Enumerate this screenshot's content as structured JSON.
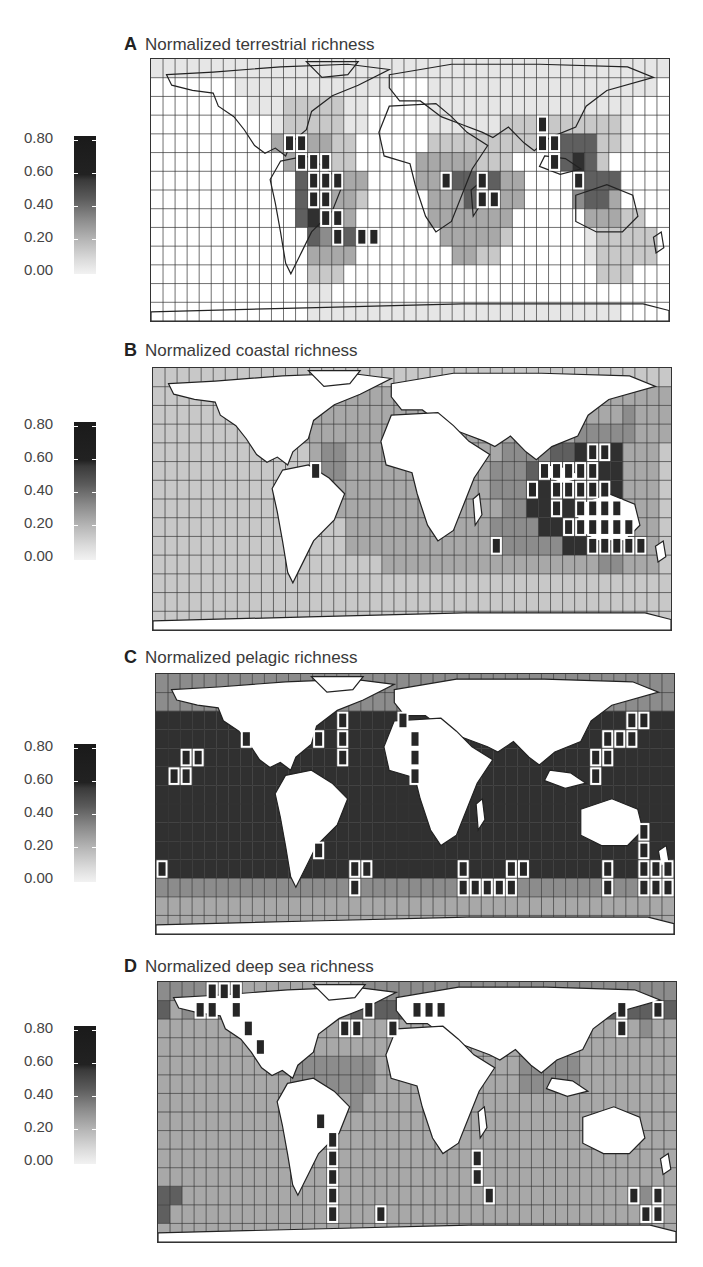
{
  "figure": {
    "panels": [
      {
        "letter": "A",
        "title": "Normalized terrestrial richness",
        "legend_ticks": [
          "0.80",
          "0.60",
          "0.40",
          "0.20",
          "0.00"
        ]
      },
      {
        "letter": "B",
        "title": "Normalized coastal richness",
        "legend_ticks": [
          "0.80",
          "0.60",
          "0.40",
          "0.20",
          "0.00"
        ]
      },
      {
        "letter": "C",
        "title": "Normalized pelagic richness",
        "legend_ticks": [
          "0.80",
          "0.60",
          "0.40",
          "0.20",
          "0.00"
        ]
      },
      {
        "letter": "D",
        "title": "Normalized deep sea richness",
        "legend_ticks": [
          "0.80",
          "0.60",
          "0.40",
          "0.20",
          "0.00"
        ]
      }
    ]
  },
  "colors": {
    "scale_low": "#f2f2f2",
    "scale_high": "#1a1a1a",
    "grid_line": "#333333",
    "land": "#ffffff",
    "highlight_outline": "#ffffff"
  },
  "chart_data": [
    {
      "type": "heatmap",
      "title": "Normalized terrestrial richness",
      "legend": {
        "min": 0.0,
        "max": 0.8,
        "ticks": [
          0.0,
          0.2,
          0.4,
          0.6,
          0.8
        ]
      },
      "grid": "equal-area world grid, ~43 x 14 cells",
      "description": "Terrestrial cells only; ocean cells blank (white). Highest richness (≥0.6, outlined) in Central America, tropical Andes/Amazon, central Africa (Congo/East Africa), Indo-Burma / SE Asia. Moderate (0.3–0.5) across South America, sub-Saharan Africa, South/SE Asia; low (0.1–0.2) in North America, Eurasia, Australia, Antarctica."
    },
    {
      "type": "heatmap",
      "title": "Normalized coastal richness",
      "legend": {
        "min": 0.0,
        "max": 0.8,
        "ticks": [
          0.0,
          0.2,
          0.4,
          0.6,
          0.8
        ]
      },
      "description": "Ocean cells shaded; land white. Peak (≥0.6, outlined) in Coral Triangle / Indo-West Pacific (Philippines, Indonesia, northern Australia), western Indian Ocean near Madagascar, Red Sea / Arabian Sea coast, Caribbean. Open ocean mostly 0.2–0.35."
    },
    {
      "type": "heatmap",
      "title": "Normalized pelagic richness",
      "legend": {
        "min": 0.0,
        "max": 0.8,
        "ticks": [
          0.0,
          0.2,
          0.4,
          0.6,
          0.8
        ]
      },
      "description": "Ocean broadly high (0.55–0.75); highest (outlined) in subtropical bands ~30–40°N/S: off Japan, NW Atlantic (US east coast), NE Atlantic off NW Africa, central N Pacific (near Hawaii), south of Africa, off SE Australia / Tasman Sea, off southern Brazil. Polar rows lower (0.3–0.4)."
    },
    {
      "type": "heatmap",
      "title": "Normalized deep sea richness",
      "legend": {
        "min": 0.0,
        "max": 0.8,
        "ticks": [
          0.0,
          0.2,
          0.4,
          0.6,
          0.8
        ]
      },
      "description": "Ocean mostly 0.25–0.4; highest (outlined) along continental margins at high latitudes: Gulf of Alaska / NE Pacific, NW Atlantic, N Atlantic (Iceland/Norway), NW Pacific (Japan/Kuril), west coast of South America, SW Atlantic off Patagonia, SW Africa, New Zealand, southern Australia."
    }
  ],
  "maps": [
    {
      "id": "A",
      "land_shaded": true,
      "rows": [
        "1111111111111111111111111111111111111111111",
        "0000000111111111111100011111111111111111110",
        "0000000011122222110000011111111111111111000",
        "0000000000122222110000011111122222222221000",
        "0000000000322332200000022222222222555221000",
        "0000000000035532200000333332220000565200000",
        "0000000000005655330000333556533000055550000",
        "0000000000005563320000033353333000045530000",
        "0000000000005653300000033333330000003332200",
        "0000000000000545500000003333320000001222220",
        "0000000000000333300000000332200000001222220",
        "0000000000000222000000000000000000000222000",
        "0000000000000110000000000000000000000000000",
        "0000000000000111111111111111111111111110000"
      ],
      "highlights": [
        [
          4,
          11
        ],
        [
          4,
          12
        ],
        [
          5,
          12
        ],
        [
          5,
          13
        ],
        [
          5,
          14
        ],
        [
          6,
          13
        ],
        [
          6,
          14
        ],
        [
          6,
          15
        ],
        [
          7,
          13
        ],
        [
          7,
          14
        ],
        [
          8,
          14
        ],
        [
          8,
          15
        ],
        [
          9,
          15
        ],
        [
          9,
          17
        ],
        [
          9,
          18
        ],
        [
          6,
          24
        ],
        [
          6,
          27
        ],
        [
          7,
          27
        ],
        [
          7,
          28
        ],
        [
          3,
          32
        ],
        [
          4,
          32
        ],
        [
          4,
          33
        ],
        [
          5,
          33
        ],
        [
          6,
          35
        ]
      ]
    },
    {
      "id": "B",
      "land_shaded": false,
      "rows": [
        "2222222222222222222222222222222222222222222",
        "2222223333333333333333333333333333333333333",
        "2222222223333333333333333333333333333334333",
        "2222222222233333333333333333333333344444333",
        "2222222222222344333333333333344445566663332",
        "2222222222222344333333333333444556666663332",
        "2222222222222233333333333333444666666663332",
        "2222222222222233333333333333344666666663332",
        "2222222222222222333333333333444466666666332",
        "2222222222222222333333333333444444666666632",
        "2222222222222222222333333333333333333443332",
        "2222222222222222222222222222222222222222222",
        "2222222222222222222222222222222222222222222",
        "2222222222222222222222222222222222222222222"
      ],
      "highlights": [
        [
          4,
          36
        ],
        [
          4,
          37
        ],
        [
          5,
          32
        ],
        [
          5,
          33
        ],
        [
          5,
          34
        ],
        [
          5,
          35
        ],
        [
          5,
          36
        ],
        [
          6,
          31
        ],
        [
          6,
          33
        ],
        [
          6,
          34
        ],
        [
          6,
          35
        ],
        [
          6,
          36
        ],
        [
          6,
          37
        ],
        [
          7,
          33
        ],
        [
          7,
          35
        ],
        [
          7,
          36
        ],
        [
          7,
          37
        ],
        [
          7,
          38
        ],
        [
          8,
          34
        ],
        [
          8,
          35
        ],
        [
          8,
          36
        ],
        [
          8,
          37
        ],
        [
          8,
          38
        ],
        [
          8,
          39
        ],
        [
          9,
          36
        ],
        [
          9,
          37
        ],
        [
          9,
          38
        ],
        [
          9,
          39
        ],
        [
          9,
          40
        ],
        [
          5,
          13
        ],
        [
          9,
          28
        ]
      ]
    },
    {
      "id": "C",
      "land_shaded": false,
      "rows": [
        "4444444444444444444444444444444444444444444",
        "4444444444444444444444444444444444444444444",
        "6666666666666666666666666666666666666666666",
        "6666666666666666666666666666666666666666666",
        "6666666666666666666666666666666666666666666",
        "6666666666666666666666666666666666666666666",
        "6666666666666666666666666666666666666666666",
        "6666666666666666666666666666666666666666666",
        "6666666666666666666666666666666666666666666",
        "6666666666666666666666666666666666666666666",
        "6666666666666666666666666666666666666666666",
        "4444444444444444444444444444444444444444444",
        "3333333333333333333333333333333333333333333",
        "3333333333333333333333333333333333333333333"
      ],
      "highlights": [
        [
          2,
          15
        ],
        [
          2,
          20
        ],
        [
          2,
          39
        ],
        [
          2,
          40
        ],
        [
          3,
          7
        ],
        [
          3,
          13
        ],
        [
          3,
          15
        ],
        [
          3,
          21
        ],
        [
          3,
          37
        ],
        [
          3,
          38
        ],
        [
          3,
          39
        ],
        [
          4,
          2
        ],
        [
          4,
          3
        ],
        [
          4,
          15
        ],
        [
          4,
          21
        ],
        [
          4,
          36
        ],
        [
          4,
          37
        ],
        [
          5,
          1
        ],
        [
          5,
          2
        ],
        [
          5,
          21
        ],
        [
          5,
          36
        ],
        [
          9,
          13
        ],
        [
          10,
          0
        ],
        [
          10,
          16
        ],
        [
          10,
          17
        ],
        [
          10,
          25
        ],
        [
          10,
          29
        ],
        [
          10,
          30
        ],
        [
          10,
          37
        ],
        [
          10,
          40
        ],
        [
          10,
          41
        ],
        [
          10,
          42
        ],
        [
          11,
          16
        ],
        [
          11,
          25
        ],
        [
          11,
          26
        ],
        [
          11,
          27
        ],
        [
          11,
          28
        ],
        [
          11,
          29
        ],
        [
          11,
          37
        ],
        [
          11,
          40
        ],
        [
          11,
          41
        ],
        [
          11,
          42
        ],
        [
          9,
          40
        ],
        [
          8,
          40
        ]
      ]
    },
    {
      "id": "D",
      "land_shaded": false,
      "rows": [
        "4444333333333333444444444444444444444444444",
        "5344444444444444555555555555555555555555555",
        "3333333344443333333333333333333333333333433",
        "3333333334443333333333333333333333333333333",
        "3333333333444444443333333333334444433333333",
        "3333333333344444443333333333334444433333333",
        "3333333333333333433333333333333333333333333",
        "3333333333333333333333333333333333333333333",
        "3333333333333333333333333333333333333333333",
        "3333333333333333333333333333333333333333333",
        "3333333333333333333333333333333333333333333",
        "5533333333333333333333333333333333333333433",
        "5333333333333333333333333333333333333333443",
        "3333333333333333333333333333333333333333333"
      ],
      "highlights": [
        [
          0,
          4
        ],
        [
          0,
          5
        ],
        [
          0,
          6
        ],
        [
          1,
          3
        ],
        [
          1,
          4
        ],
        [
          1,
          6
        ],
        [
          1,
          17
        ],
        [
          1,
          21
        ],
        [
          1,
          22
        ],
        [
          1,
          23
        ],
        [
          1,
          38
        ],
        [
          1,
          41
        ],
        [
          2,
          7
        ],
        [
          2,
          15
        ],
        [
          2,
          16
        ],
        [
          2,
          19
        ],
        [
          2,
          38
        ],
        [
          3,
          8
        ],
        [
          7,
          13
        ],
        [
          8,
          14
        ],
        [
          9,
          14
        ],
        [
          10,
          14
        ],
        [
          11,
          14
        ],
        [
          12,
          14
        ],
        [
          12,
          18
        ],
        [
          9,
          26
        ],
        [
          10,
          26
        ],
        [
          11,
          27
        ],
        [
          11,
          39
        ],
        [
          11,
          41
        ],
        [
          12,
          40
        ],
        [
          12,
          41
        ]
      ]
    }
  ]
}
